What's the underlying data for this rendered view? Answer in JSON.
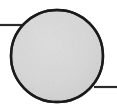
{
  "figure": {
    "title": "Circle node with left and right connector lines",
    "type": "line-drawing",
    "canvas": {
      "width": 117,
      "height": 112,
      "background_color": "#ffffff"
    },
    "shapes": {
      "circle": {
        "name": "shaded-circle",
        "center_x": 57,
        "center_y": 56,
        "radius": 46,
        "fill_color": "#d6d6d6",
        "stroke_color": "#1a1a1a",
        "stroke_width": 2.4,
        "texture": "scanned-paper-grain"
      },
      "left_connector": {
        "name": "left-connector-line",
        "x1": 0,
        "y1": 25,
        "x2": 28,
        "y2": 25,
        "stroke_color": "#2b2b2b",
        "stroke_width": 2.2
      },
      "right_connector": {
        "name": "right-connector-line",
        "x1": 96,
        "y1": 87,
        "x2": 117,
        "y2": 87,
        "stroke_color": "#2b2b2b",
        "stroke_width": 2.2
      }
    },
    "labels": []
  }
}
